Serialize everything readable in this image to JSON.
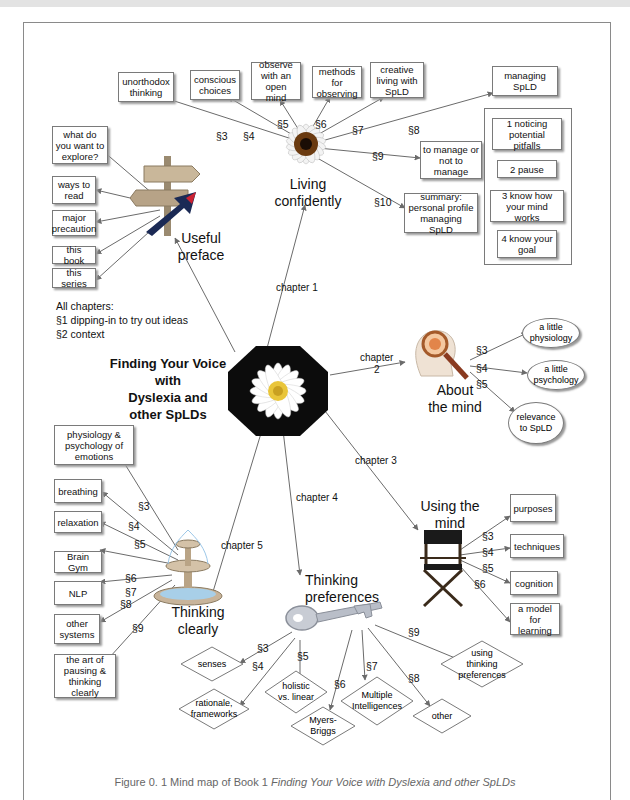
{
  "center": {
    "title_lines": [
      "Finding Your Voice",
      "with",
      "Dyslexia and",
      "other SpLDs"
    ],
    "image": "daisy-octagon"
  },
  "note": {
    "line1": "All chapters:",
    "line2": "§1 dipping-in to try out ideas",
    "line3": "§2 context"
  },
  "preface": {
    "title_lines": [
      "Useful",
      "preface"
    ],
    "image": "signpost",
    "items": [
      "what do you want to explore?",
      "ways to read",
      "major precaution",
      "this book",
      "this series"
    ]
  },
  "chapter1": {
    "link_label": "chapter 1",
    "title_lines": [
      "Living",
      "confidently"
    ],
    "image": "sunflower",
    "sections": [
      {
        "sec": "§3",
        "label": "unorthodox thinking"
      },
      {
        "sec": "§4",
        "label": "conscious choices"
      },
      {
        "sec": "§5",
        "label": "observe with an open mind"
      },
      {
        "sec": "§6",
        "label": "methods for observing"
      },
      {
        "sec": "§7",
        "label": "creative living with SpLD"
      },
      {
        "sec": "§8",
        "label": "managing SpLD"
      },
      {
        "sec": "§9",
        "label": "to manage or not to manage"
      },
      {
        "sec": "§10",
        "label": "summary: personal profile managing SpLD"
      }
    ],
    "managing_steps": [
      "1 noticing potential pitfalls",
      "2 pause",
      "3 know how your mind works",
      "4 know your goal"
    ]
  },
  "chapter2": {
    "link_label_lines": [
      "chapter",
      "2"
    ],
    "title_lines": [
      "About",
      "the mind"
    ],
    "image": "head-magnifier",
    "sections": [
      {
        "sec": "§3",
        "label": "a little physiology"
      },
      {
        "sec": "§4",
        "label": "a little psychology"
      },
      {
        "sec": "§5",
        "label": "relevance to SpLD"
      }
    ]
  },
  "chapter3": {
    "link_label": "chapter 3",
    "title_lines": [
      "Using the",
      "mind"
    ],
    "image": "directors-chair",
    "sections": [
      {
        "sec": "§3",
        "label": "purposes"
      },
      {
        "sec": "§4",
        "label": "techniques"
      },
      {
        "sec": "§5",
        "label": "cognition"
      },
      {
        "sec": "§6",
        "label": "a model for learning"
      }
    ]
  },
  "chapter4": {
    "link_label": "chapter 4",
    "title_lines": [
      "Thinking",
      "preferences"
    ],
    "image": "key",
    "sections": [
      {
        "sec": "§3",
        "label": "senses"
      },
      {
        "sec": "§4",
        "label": "rationale, frameworks"
      },
      {
        "sec": "§5",
        "label": "holistic vs. linear"
      },
      {
        "sec": "§6",
        "label": "Myers-Briggs"
      },
      {
        "sec": "§7",
        "label": "Multiple Intelligences"
      },
      {
        "sec": "§8",
        "label": "other"
      },
      {
        "sec": "§9",
        "label": "using thinking preferences"
      }
    ]
  },
  "chapter5": {
    "link_label": "chapter 5",
    "title_lines": [
      "Thinking",
      "clearly"
    ],
    "image": "fountain",
    "top_item": "physiology & psychology of emotions",
    "sections": [
      {
        "sec": "§3",
        "label": "breathing"
      },
      {
        "sec": "§4",
        "label": "relaxation"
      },
      {
        "sec": "§5",
        "label": ""
      },
      {
        "sec": "§6",
        "label": "Brain Gym"
      },
      {
        "sec": "§7",
        "label": "NLP"
      },
      {
        "sec": "§8",
        "label": "other systems"
      },
      {
        "sec": "§9",
        "label": "the art of pausing & thinking clearly"
      }
    ]
  },
  "caption": {
    "prefix": "Figure 0. 1 Mind map of Book 1 ",
    "title": "Finding Your Voice with Dyslexia and other SpLDs"
  },
  "colors": {
    "line": "#6b6b6b",
    "box_border": "#7a7a7a",
    "caption_text": "#666666",
    "frame": "#8a8a8a"
  }
}
